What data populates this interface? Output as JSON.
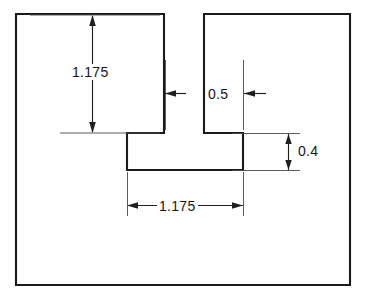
{
  "drawing": {
    "title": "Slotted block cross-section dimensioned drawing",
    "background_color": "#ffffff",
    "line_color": "#1a1a1a",
    "dimension_color": "#1f1f1f",
    "extension_line_color": "#4a4a4a",
    "units_note": "",
    "outline": {
      "name": "slotted-block-profile",
      "description": "Rectangular block with a T-shaped slot cut from the top edge"
    },
    "dimensions": [
      {
        "id": "slot-height",
        "label": "1.175",
        "orientation": "vertical",
        "placement": "left-of-slot",
        "measures": "depth of upper slot from top edge to shoulder"
      },
      {
        "id": "slot-width",
        "label": "0.5",
        "orientation": "horizontal",
        "placement": "upper-slot",
        "measures": "width of upper slot opening"
      },
      {
        "id": "pocket-depth",
        "label": "0.4",
        "orientation": "vertical",
        "placement": "right-side",
        "measures": "height of lower pocket"
      },
      {
        "id": "pocket-width",
        "label": "1.175",
        "orientation": "horizontal",
        "placement": "below-pocket",
        "measures": "width of lower pocket"
      }
    ]
  }
}
